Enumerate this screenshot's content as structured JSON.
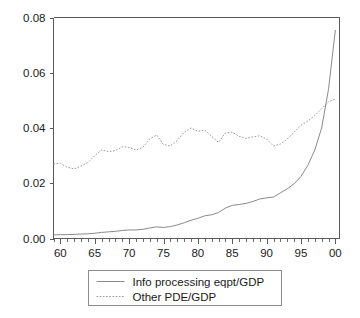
{
  "chart_data": {
    "type": "line",
    "title": "",
    "xlabel": "",
    "ylabel": "",
    "xlim": [
      1959,
      2000.6
    ],
    "ylim": [
      0.0,
      0.08
    ],
    "grid": false,
    "legend_position": "below-center",
    "y_ticks": [
      0.0,
      0.02,
      0.04,
      0.06,
      0.08
    ],
    "y_tick_labels": [
      "0.00",
      "0.02",
      "0.04",
      "0.06",
      "0.08"
    ],
    "x_ticks": [
      1960,
      1965,
      1970,
      1975,
      1980,
      1985,
      1990,
      1995,
      2000
    ],
    "x_tick_labels": [
      "60",
      "65",
      "70",
      "75",
      "80",
      "85",
      "90",
      "95",
      "00"
    ],
    "x_minor_tick_step": 1,
    "x": [
      1959,
      1960,
      1961,
      1962,
      1963,
      1964,
      1965,
      1966,
      1967,
      1968,
      1969,
      1970,
      1971,
      1972,
      1973,
      1974,
      1975,
      1976,
      1977,
      1978,
      1979,
      1980,
      1981,
      1982,
      1983,
      1984,
      1985,
      1986,
      1987,
      1988,
      1989,
      1990,
      1991,
      1992,
      1993,
      1994,
      1995,
      1996,
      1997,
      1998,
      1999,
      2000
    ],
    "series": [
      {
        "name": "Info processing eqpt/GDP",
        "style": "solid",
        "color": "#8a8a8a",
        "values": [
          0.0013,
          0.0014,
          0.0014,
          0.0015,
          0.0016,
          0.0017,
          0.0019,
          0.0022,
          0.0024,
          0.0026,
          0.0029,
          0.0031,
          0.0031,
          0.0033,
          0.0038,
          0.0042,
          0.004,
          0.0043,
          0.0049,
          0.0057,
          0.0066,
          0.0073,
          0.0082,
          0.0086,
          0.0094,
          0.011,
          0.012,
          0.0123,
          0.0127,
          0.0134,
          0.0143,
          0.0147,
          0.015,
          0.0165,
          0.018,
          0.0198,
          0.0225,
          0.0265,
          0.032,
          0.04,
          0.054,
          0.0755
        ]
      },
      {
        "name": "Other PDE/GDP",
        "style": "dotted",
        "color": "#9a9a9a",
        "values": [
          0.027,
          0.0272,
          0.0258,
          0.0252,
          0.0262,
          0.0275,
          0.03,
          0.032,
          0.0315,
          0.0318,
          0.0332,
          0.033,
          0.032,
          0.033,
          0.036,
          0.0375,
          0.034,
          0.0335,
          0.0355,
          0.0385,
          0.04,
          0.0388,
          0.0392,
          0.037,
          0.0348,
          0.0382,
          0.0385,
          0.037,
          0.0362,
          0.0368,
          0.0372,
          0.036,
          0.0335,
          0.0342,
          0.036,
          0.0385,
          0.041,
          0.0425,
          0.0445,
          0.047,
          0.0495,
          0.0505
        ]
      }
    ]
  },
  "legend": {
    "items": [
      {
        "label": "Info processing eqpt/GDP",
        "style": "solid"
      },
      {
        "label": "Other PDE/GDP",
        "style": "dotted"
      }
    ]
  }
}
